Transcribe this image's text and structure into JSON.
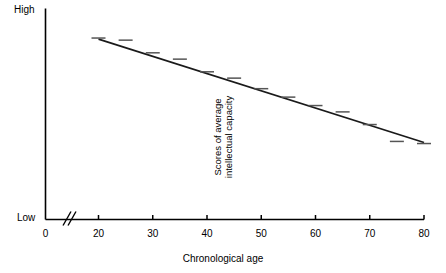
{
  "chart_data": {
    "type": "scatter",
    "title": "",
    "xlabel": "Chronological age",
    "ylabel": "Scores of average intellectual capacity",
    "ylabel_lines": [
      "Scores of average",
      "intellectual capacity"
    ],
    "x": [
      20,
      25,
      30,
      35,
      40,
      45,
      50,
      55,
      60,
      65,
      70,
      75,
      80
    ],
    "y": [
      0.86,
      0.85,
      0.79,
      0.76,
      0.7,
      0.67,
      0.62,
      0.58,
      0.54,
      0.51,
      0.45,
      0.37,
      0.36
    ],
    "values": [
      0.86,
      0.85,
      0.79,
      0.76,
      0.7,
      0.67,
      0.62,
      0.58,
      0.54,
      0.51,
      0.45,
      0.37,
      0.36
    ],
    "xlim": [
      0,
      80
    ],
    "ylim": [
      0,
      1
    ],
    "xticks": [
      0,
      20,
      30,
      40,
      50,
      60,
      70,
      80
    ],
    "xtick_labels": [
      "0",
      "20",
      "30",
      "40",
      "50",
      "60",
      "70",
      "80"
    ],
    "ytick_labels": [
      "High",
      "Low"
    ],
    "y_axis_top_label": "High",
    "y_axis_bottom_label": "Low",
    "grid": false,
    "legend": false,
    "axis_break": true,
    "axis_break_x": 12,
    "marker_style": "horizontal-dash",
    "trendline": {
      "type": "linear",
      "x_start": 20,
      "y_start": 0.855,
      "x_end": 80,
      "y_end": 0.365
    },
    "annotations": []
  },
  "axis": {
    "high_label": "High",
    "low_label": "Low",
    "x_title": "Chronological age"
  },
  "colors": {
    "axis": "#000000",
    "line": "#1a1a1a",
    "marker": "#555555",
    "background": "#ffffff"
  }
}
